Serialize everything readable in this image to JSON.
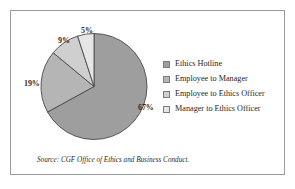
{
  "figure": {
    "source_note": "Source: CGF Office of Ethics and Business Conduct.",
    "frame_color": "#9a9a9a",
    "background": "#ffffff"
  },
  "chart_data": {
    "type": "pie",
    "title": "",
    "subtitle": "",
    "xlabel": "",
    "ylabel": "",
    "legend_position": "right",
    "grid": false,
    "start_angle_deg": 0,
    "direction": "clockwise",
    "unit": "%",
    "categories": [
      "Ethics Hotline",
      "Employee to Manager",
      "Employee to Ethics Officer",
      "Manager to Ethics Officer"
    ],
    "values": [
      67,
      19,
      9,
      5
    ],
    "labels": [
      "67%",
      "19%",
      "9%",
      "5%"
    ],
    "colors": [
      "#9e9e9e",
      "#b5b5b5",
      "#cfcfcf",
      "#e6e6e6"
    ],
    "slice_border_color": "#4a4a4a",
    "annotations": [
      "Source: CGF Office of Ethics and Business Conduct."
    ]
  },
  "legend": {
    "items": [
      {
        "label": "Ethics Hotline",
        "color": "#9e9e9e"
      },
      {
        "label": "Employee to Manager",
        "color": "#b5b5b5"
      },
      {
        "label": "Employee to Ethics Officer",
        "color": "#cfcfcf"
      },
      {
        "label": "Manager to Ethics Officer",
        "color": "#e6e6e6"
      }
    ]
  }
}
